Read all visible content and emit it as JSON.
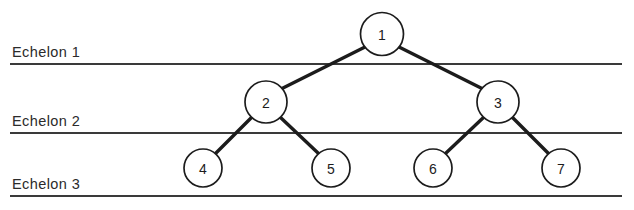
{
  "figure": {
    "background_color": "#ffffff",
    "line_color": "#1c1c1c",
    "rule_color": "#3a3a3a",
    "width": 634,
    "height": 210
  },
  "echelons": [
    {
      "label": "Echelon 1",
      "label_x": 12,
      "label_y": 57,
      "rule_y": 64,
      "rule_x1": 10,
      "rule_x2": 622
    },
    {
      "label": "Echelon 2",
      "label_x": 12,
      "label_y": 126,
      "rule_y": 133,
      "rule_x1": 10,
      "rule_x2": 622
    },
    {
      "label": "Echelon 3",
      "label_x": 12,
      "label_y": 189,
      "rule_y": 196,
      "rule_x1": 10,
      "rule_x2": 622
    }
  ],
  "nodes": [
    {
      "id": "1",
      "label": "1",
      "cx": 382,
      "cy": 34,
      "r": 21.5,
      "echelon": 1
    },
    {
      "id": "2",
      "label": "2",
      "cx": 266,
      "cy": 102,
      "r": 21.0,
      "echelon": 2
    },
    {
      "id": "3",
      "label": "3",
      "cx": 498,
      "cy": 102,
      "r": 21.0,
      "echelon": 2
    },
    {
      "id": "4",
      "label": "4",
      "cx": 203,
      "cy": 168,
      "r": 19.0,
      "echelon": 3
    },
    {
      "id": "5",
      "label": "5",
      "cx": 331,
      "cy": 168,
      "r": 19.0,
      "echelon": 3
    },
    {
      "id": "6",
      "label": "6",
      "cx": 433,
      "cy": 168,
      "r": 19.0,
      "echelon": 3
    },
    {
      "id": "7",
      "label": "7",
      "cx": 561,
      "cy": 168,
      "r": 19.0,
      "echelon": 3
    }
  ],
  "edges": [
    {
      "from": "1",
      "to": "2",
      "x1": 365,
      "y1": 47,
      "x2": 281,
      "y2": 89
    },
    {
      "from": "1",
      "to": "3",
      "x1": 399,
      "y1": 47,
      "x2": 483,
      "y2": 89
    },
    {
      "from": "2",
      "to": "4",
      "x1": 252,
      "y1": 117,
      "x2": 216,
      "y2": 153
    },
    {
      "from": "2",
      "to": "5",
      "x1": 280,
      "y1": 117,
      "x2": 318,
      "y2": 153
    },
    {
      "from": "3",
      "to": "6",
      "x1": 484,
      "y1": 117,
      "x2": 446,
      "y2": 153
    },
    {
      "from": "3",
      "to": "7",
      "x1": 512,
      "y1": 117,
      "x2": 548,
      "y2": 153
    }
  ]
}
